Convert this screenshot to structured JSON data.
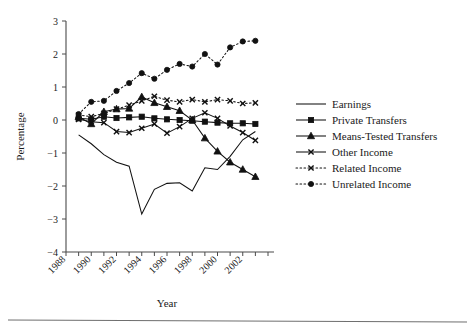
{
  "figure": {
    "xlabel": "Year",
    "ylabel": "Percentage"
  },
  "chart_data": {
    "type": "line",
    "title": "",
    "xlabel": "Year",
    "ylabel": "Percentage",
    "xlim": [
      1988,
      2004
    ],
    "ylim": [
      -4,
      3
    ],
    "xticks": [
      1988,
      1990,
      1992,
      1994,
      1996,
      1998,
      2000,
      2002
    ],
    "xtick_labels": [
      "1988",
      "1990",
      "1992",
      "1994",
      "1996",
      "1998",
      "2000",
      "2002"
    ],
    "yticks": [
      -4,
      -3,
      -2,
      -1,
      0,
      1,
      2,
      3
    ],
    "ytick_labels": [
      "-4",
      "-3",
      "-2",
      "-1",
      "0",
      "1",
      "2",
      "3"
    ],
    "grid": false,
    "legend_position": "right",
    "x": [
      1989,
      1990,
      1991,
      1992,
      1993,
      1994,
      1995,
      1996,
      1997,
      1998,
      1999,
      2000,
      2001,
      2002,
      2003
    ],
    "series": [
      {
        "name": "Earnings",
        "marker": "none",
        "linestyle": "solid",
        "values": [
          -0.45,
          -0.72,
          -1.05,
          -1.28,
          -1.4,
          -2.85,
          -2.1,
          -1.92,
          -1.9,
          -2.15,
          -1.45,
          -1.5,
          -1.1,
          -0.6,
          -0.35
        ]
      },
      {
        "name": "Private Transfers",
        "marker": "square",
        "linestyle": "solid",
        "values": [
          0.05,
          0.02,
          0.1,
          0.06,
          0.08,
          0.1,
          0.05,
          0.02,
          0.0,
          -0.02,
          -0.05,
          -0.08,
          -0.1,
          -0.1,
          -0.12
        ]
      },
      {
        "name": "Means-Tested Transfers",
        "marker": "triangle",
        "linestyle": "solid",
        "values": [
          0.1,
          -0.12,
          0.25,
          0.33,
          0.35,
          0.7,
          0.52,
          0.4,
          0.28,
          0.0,
          -0.55,
          -0.95,
          -1.28,
          -1.5,
          -1.72
        ]
      },
      {
        "name": "Other Income",
        "marker": "x",
        "linestyle": "solid",
        "values": [
          0.02,
          -0.05,
          -0.08,
          -0.35,
          -0.38,
          -0.25,
          -0.12,
          -0.4,
          -0.2,
          0.05,
          0.22,
          0.05,
          -0.18,
          -0.38,
          -0.62
        ]
      },
      {
        "name": "Related Income",
        "marker": "x",
        "linestyle": "dotted",
        "values": [
          0.15,
          0.1,
          0.2,
          0.33,
          0.45,
          0.58,
          0.72,
          0.6,
          0.55,
          0.62,
          0.55,
          0.62,
          0.58,
          0.5,
          0.52
        ]
      },
      {
        "name": "Unrelated Income",
        "marker": "circle",
        "linestyle": "dotted",
        "values": [
          0.18,
          0.55,
          0.58,
          0.88,
          1.12,
          1.42,
          1.25,
          1.52,
          1.7,
          1.62,
          2.0,
          1.68,
          2.2,
          2.38,
          2.4
        ]
      }
    ]
  },
  "legend": {
    "items": [
      {
        "label": "Earnings"
      },
      {
        "label": "Private Transfers"
      },
      {
        "label": "Means-Tested Transfers"
      },
      {
        "label": "Other Income"
      },
      {
        "label": "Related Income"
      },
      {
        "label": "Unrelated Income"
      }
    ]
  }
}
